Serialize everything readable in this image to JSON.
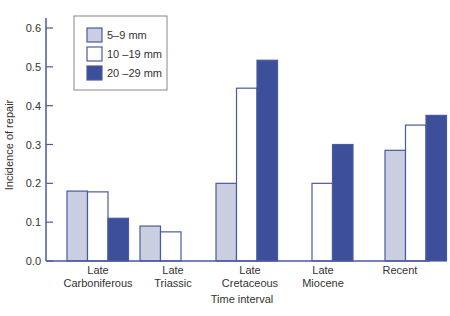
{
  "chart_data": {
    "type": "bar",
    "title": "",
    "xlabel": "Time interval",
    "ylabel": "Incidence of repair",
    "ylim": [
      0,
      0.6
    ],
    "yticks": [
      "0.0",
      "0.1",
      "0.2",
      "0.3",
      "0.4",
      "0.5",
      "0.6"
    ],
    "grid": false,
    "legend_position": "upper-left",
    "categories": [
      [
        "Late",
        "Carboniferous"
      ],
      [
        "Late",
        "Triassic"
      ],
      [
        "Late",
        "Cretaceous"
      ],
      [
        "Late",
        "Miocene"
      ],
      [
        "Recent"
      ]
    ],
    "series": [
      {
        "name": "5–9 mm",
        "color": "#c9cfe0",
        "values": [
          0.18,
          0.09,
          0.2,
          null,
          0.285
        ]
      },
      {
        "name": "10 –19 mm",
        "color": "#ffffff",
        "values": [
          0.178,
          0.075,
          0.445,
          0.2,
          0.35
        ]
      },
      {
        "name": "20 –29 mm",
        "color": "#3d4f9a",
        "values": [
          0.11,
          null,
          0.517,
          0.3,
          0.375
        ]
      }
    ]
  },
  "colors": {
    "axis": "#4a5a9e",
    "stroke": "#4a5a9e"
  }
}
